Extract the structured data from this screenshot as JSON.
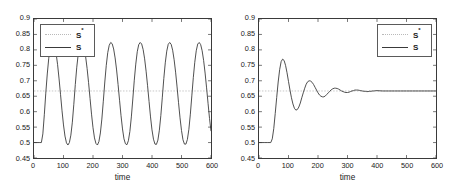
{
  "figure": {
    "xlabel": "time",
    "panels": [
      "left",
      "right"
    ]
  },
  "legend": {
    "sstar_label": "S",
    "sstar_sup": "*",
    "s_label": "S"
  },
  "axis": {
    "yticks": [
      "0.9",
      "0.85",
      "0.8",
      "0.75",
      "0.7",
      "0.65",
      "0.6",
      "0.55",
      "0.5",
      "0.45"
    ],
    "xticks": [
      "0",
      "100",
      "200",
      "300",
      "400",
      "500",
      "600"
    ],
    "ylim": [
      0.45,
      0.9
    ],
    "xlim": [
      0,
      600
    ]
  },
  "colors": {
    "curve": "#3a3a3a",
    "reference": "#b9b9b9",
    "axis": "#3a3a3a",
    "background": "#ffffff"
  },
  "chart_data": [
    {
      "type": "line",
      "title": "",
      "xlabel": "time",
      "ylabel": "",
      "xlim": [
        0,
        600
      ],
      "ylim": [
        0.45,
        0.9
      ],
      "grid": false,
      "legend_position": "top-left",
      "xticks": [
        0,
        100,
        200,
        300,
        400,
        500,
        600
      ],
      "yticks": [
        0.45,
        0.5,
        0.55,
        0.6,
        0.65,
        0.7,
        0.75,
        0.8,
        0.85,
        0.9
      ],
      "series": [
        {
          "name": "S*",
          "style": "dotted",
          "description": "constant reference level",
          "constant_value": 0.667,
          "x": [
            0,
            600
          ],
          "values": [
            0.667,
            0.667
          ]
        },
        {
          "name": "S",
          "style": "solid",
          "description": "sustained limit-cycle oscillation, flat at 0.5 until t=25, then periodic with period ~100, min ~0.49, max ~0.825",
          "x": [
            0,
            10,
            20,
            25,
            30,
            35,
            40,
            45,
            50,
            55,
            60,
            65,
            70,
            75,
            80,
            85,
            90,
            95,
            100,
            105,
            110,
            115,
            120,
            125,
            130,
            135,
            140,
            145,
            150,
            155,
            160,
            165,
            170,
            175,
            180,
            185,
            190,
            195,
            200,
            205,
            210,
            215,
            220,
            225,
            230,
            235,
            240,
            245,
            250,
            255,
            260,
            265,
            270,
            275,
            280,
            285,
            290,
            295,
            300,
            305,
            310,
            315,
            320,
            325,
            330,
            335,
            340,
            345,
            350,
            355,
            360,
            365,
            370,
            375,
            380,
            385,
            390,
            395,
            400,
            405,
            410,
            415,
            420,
            425,
            430,
            435,
            440,
            445,
            450,
            455,
            460,
            465,
            470,
            475,
            480,
            485,
            490,
            495,
            500,
            505,
            510,
            515,
            520,
            525,
            530,
            535,
            540,
            545,
            550,
            555,
            560,
            565,
            570,
            575,
            580,
            585,
            590,
            595,
            600
          ],
          "values": [
            0.5,
            0.5,
            0.5,
            0.5,
            0.528,
            0.59,
            0.66,
            0.722,
            0.773,
            0.806,
            0.822,
            0.824,
            0.812,
            0.788,
            0.752,
            0.706,
            0.655,
            0.603,
            0.557,
            0.521,
            0.499,
            0.492,
            0.5,
            0.524,
            0.566,
            0.624,
            0.688,
            0.744,
            0.787,
            0.813,
            0.824,
            0.821,
            0.806,
            0.778,
            0.74,
            0.694,
            0.643,
            0.592,
            0.548,
            0.515,
            0.497,
            0.492,
            0.503,
            0.531,
            0.576,
            0.634,
            0.696,
            0.75,
            0.791,
            0.815,
            0.824,
            0.82,
            0.803,
            0.774,
            0.735,
            0.688,
            0.637,
            0.587,
            0.544,
            0.512,
            0.496,
            0.493,
            0.506,
            0.536,
            0.583,
            0.641,
            0.702,
            0.754,
            0.794,
            0.817,
            0.824,
            0.819,
            0.801,
            0.771,
            0.731,
            0.684,
            0.633,
            0.583,
            0.541,
            0.511,
            0.495,
            0.494,
            0.508,
            0.54,
            0.588,
            0.647,
            0.707,
            0.758,
            0.796,
            0.818,
            0.824,
            0.818,
            0.799,
            0.768,
            0.728,
            0.68,
            0.629,
            0.58,
            0.539,
            0.509,
            0.495,
            0.495,
            0.51,
            0.543,
            0.592,
            0.651,
            0.71,
            0.76,
            0.797,
            0.819,
            0.824,
            0.817,
            0.797,
            0.766,
            0.725,
            0.677,
            0.627,
            0.578,
            0.537
          ]
        }
      ]
    },
    {
      "type": "line",
      "title": "",
      "xlabel": "time",
      "ylabel": "",
      "xlim": [
        0,
        600
      ],
      "ylim": [
        0.45,
        0.9
      ],
      "grid": false,
      "legend_position": "top-right",
      "xticks": [
        0,
        100,
        200,
        300,
        400,
        500,
        600
      ],
      "yticks": [
        0.45,
        0.5,
        0.55,
        0.6,
        0.65,
        0.7,
        0.75,
        0.8,
        0.85,
        0.9
      ],
      "series": [
        {
          "name": "S*",
          "style": "dotted",
          "description": "constant reference level",
          "constant_value": 0.667,
          "x": [
            0,
            600
          ],
          "values": [
            0.667,
            0.667
          ]
        },
        {
          "name": "S",
          "style": "solid",
          "description": "damped oscillation, flat at 0.5 until t=40, overshoot peak 0.77 at t=80, trough 0.605 at t=125, converging to 0.667",
          "x": [
            0,
            10,
            20,
            30,
            40,
            45,
            50,
            55,
            60,
            65,
            70,
            75,
            80,
            85,
            90,
            95,
            100,
            105,
            110,
            115,
            120,
            125,
            130,
            135,
            140,
            145,
            150,
            155,
            160,
            165,
            170,
            175,
            180,
            185,
            190,
            195,
            200,
            205,
            210,
            215,
            220,
            225,
            230,
            235,
            240,
            245,
            250,
            255,
            260,
            265,
            270,
            275,
            280,
            285,
            290,
            295,
            300,
            305,
            310,
            315,
            320,
            325,
            330,
            335,
            340,
            345,
            350,
            355,
            360,
            365,
            370,
            375,
            380,
            385,
            390,
            395,
            400,
            420,
            440,
            460,
            480,
            500,
            520,
            540,
            560,
            580,
            600
          ],
          "values": [
            0.5,
            0.5,
            0.5,
            0.5,
            0.5,
            0.512,
            0.545,
            0.594,
            0.646,
            0.696,
            0.736,
            0.762,
            0.77,
            0.766,
            0.75,
            0.726,
            0.698,
            0.67,
            0.645,
            0.625,
            0.611,
            0.605,
            0.607,
            0.615,
            0.628,
            0.645,
            0.661,
            0.676,
            0.689,
            0.697,
            0.7,
            0.699,
            0.695,
            0.688,
            0.679,
            0.67,
            0.661,
            0.654,
            0.65,
            0.648,
            0.648,
            0.651,
            0.656,
            0.661,
            0.666,
            0.671,
            0.674,
            0.676,
            0.676,
            0.675,
            0.673,
            0.67,
            0.667,
            0.665,
            0.663,
            0.662,
            0.662,
            0.663,
            0.665,
            0.667,
            0.668,
            0.67,
            0.67,
            0.67,
            0.669,
            0.668,
            0.667,
            0.666,
            0.666,
            0.665,
            0.665,
            0.666,
            0.666,
            0.667,
            0.667,
            0.668,
            0.668,
            0.667,
            0.667,
            0.667,
            0.667,
            0.667,
            0.667,
            0.667,
            0.667,
            0.667,
            0.667
          ]
        }
      ]
    }
  ]
}
